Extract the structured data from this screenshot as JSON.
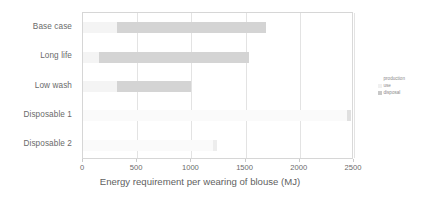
{
  "chart_data": {
    "type": "bar",
    "orientation": "horizontal",
    "stacked": true,
    "title": "",
    "xlabel": "Energy requirement per wearing of blouse (MJ)",
    "ylabel": "",
    "xlim": [
      0,
      2500
    ],
    "xticks": [
      0,
      500,
      1000,
      1500,
      2000,
      2500
    ],
    "xtick_labels": [
      "0",
      "500",
      "1000",
      "1500",
      "2000",
      "2500"
    ],
    "grid": true,
    "legend_position": "right",
    "legend_title": "production",
    "categories": [
      "Base case",
      "Long life",
      "Low wash",
      "Disposable 1",
      "Disposable 2"
    ],
    "series": [
      {
        "name": "production",
        "color": "#f4f4f4",
        "values": [
          310,
          150,
          310,
          2440,
          1200
        ]
      },
      {
        "name": "use",
        "color": "#e8e8e8",
        "values": [
          0,
          0,
          0,
          0,
          0
        ]
      },
      {
        "name": "disposal",
        "color": "#d2d2d2",
        "values": [
          1380,
          1380,
          690,
          30,
          40
        ]
      }
    ],
    "bar_segments": [
      {
        "category": "Base case",
        "segments": [
          {
            "series": "production",
            "start": 0,
            "end": 310,
            "color": "#f4f4f4"
          },
          {
            "series": "disposal",
            "start": 310,
            "end": 1690,
            "color": "#d4d4d4"
          }
        ],
        "total": 1690
      },
      {
        "category": "Long life",
        "segments": [
          {
            "series": "production",
            "start": 0,
            "end": 150,
            "color": "#f4f4f4"
          },
          {
            "series": "disposal",
            "start": 150,
            "end": 1530,
            "color": "#d4d4d4"
          }
        ],
        "total": 1530
      },
      {
        "category": "Low wash",
        "segments": [
          {
            "series": "production",
            "start": 0,
            "end": 310,
            "color": "#f4f4f4"
          },
          {
            "series": "disposal",
            "start": 310,
            "end": 1000,
            "color": "#d4d4d4"
          }
        ],
        "total": 1000
      },
      {
        "category": "Disposable 1",
        "segments": [
          {
            "series": "production",
            "start": 0,
            "end": 2440,
            "color": "#fafafa"
          },
          {
            "series": "disposal",
            "start": 2440,
            "end": 2470,
            "color": "#e0e0e0"
          }
        ],
        "total": 2470
      },
      {
        "category": "Disposable 2",
        "segments": [
          {
            "series": "production",
            "start": 0,
            "end": 1200,
            "color": "#fafafa"
          },
          {
            "series": "disposal",
            "start": 1200,
            "end": 1240,
            "color": "#ededed"
          }
        ],
        "total": 1240
      }
    ]
  },
  "legend": {
    "title": "production",
    "items": [
      {
        "label": "use",
        "color": "#f0f0f0"
      },
      {
        "label": "disposal",
        "color": "#c8c8c8"
      }
    ]
  },
  "axis": {
    "x_title": "Energy requirement per wearing of blouse (MJ)"
  },
  "colors": {
    "plot_border": "#d6d6d6",
    "gridline": "#e3e3e3",
    "text": "#6a6a6a",
    "background": "#ffffff"
  }
}
